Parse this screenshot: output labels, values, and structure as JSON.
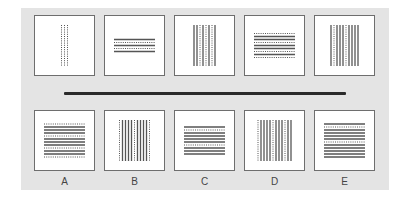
{
  "question": {
    "sequence": [
      {
        "id": "q1",
        "orientation": "vertical",
        "pattern": [
          "dotted",
          "dotted",
          "dotted"
        ]
      },
      {
        "id": "q2",
        "orientation": "horizontal",
        "pattern": [
          "solid",
          "dotted",
          "solid",
          "dotted",
          "solid"
        ]
      },
      {
        "id": "q3",
        "orientation": "vertical",
        "pattern": [
          "solid",
          "solid",
          "dotted",
          "solid",
          "dotted",
          "solid",
          "dotted",
          "solid"
        ]
      },
      {
        "id": "q4",
        "orientation": "horizontal",
        "pattern": [
          "dotted",
          "solid",
          "solid",
          "dotted",
          "solid",
          "solid",
          "dotted",
          "solid",
          "dotted"
        ]
      },
      {
        "id": "q5",
        "orientation": "vertical",
        "pattern": [
          "solid",
          "dotted",
          "solid",
          "solid",
          "solid",
          "dotted",
          "solid",
          "solid",
          "solid",
          "solid"
        ]
      }
    ]
  },
  "options": [
    {
      "label": "A",
      "orientation": "horizontal",
      "pattern": [
        "dotted",
        "solid",
        "solid",
        "solid",
        "dotted",
        "solid",
        "solid",
        "solid",
        "dotted",
        "solid",
        "solid",
        "dotted"
      ]
    },
    {
      "label": "B",
      "orientation": "vertical",
      "pattern": [
        "dotted",
        "solid",
        "solid",
        "solid",
        "solid",
        "dotted",
        "solid",
        "solid",
        "solid",
        "solid",
        "dotted"
      ]
    },
    {
      "label": "C",
      "orientation": "horizontal",
      "pattern": [
        "solid",
        "dotted",
        "solid",
        "solid",
        "solid",
        "solid",
        "dotted",
        "solid",
        "solid",
        "solid"
      ]
    },
    {
      "label": "D",
      "orientation": "vertical",
      "pattern": [
        "dotted",
        "solid",
        "solid",
        "solid",
        "solid",
        "dotted",
        "solid",
        "solid",
        "solid",
        "dotted",
        "solid",
        "solid"
      ]
    },
    {
      "label": "E",
      "orientation": "horizontal",
      "pattern": [
        "solid",
        "dotted",
        "solid",
        "solid",
        "solid",
        "solid",
        "dotted",
        "solid",
        "solid",
        "solid",
        "solid",
        "solid"
      ]
    }
  ],
  "colors": {
    "panel": "#e4e4e4",
    "box_border": "#6e6e6e",
    "line": "#555555",
    "separator": "#2a2a2a"
  }
}
